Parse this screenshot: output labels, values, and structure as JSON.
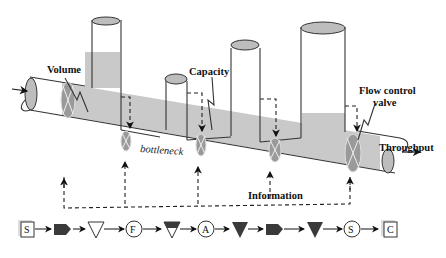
{
  "diagram": {
    "labels": {
      "volume": "Volume",
      "capacity": "Capacity",
      "flow_control_valve_line1": "Flow control",
      "flow_control_valve_line2": "valve",
      "bottleneck": "bottleneck",
      "throughput": "Throughput",
      "information": "Information"
    },
    "colors": {
      "fluid": "#c9c9c9",
      "valve": "#9a9a9a",
      "cap": "#bdbdbd",
      "outline": "#333333",
      "dark_symbol": "#3a3a3a"
    },
    "flow_sequence": [
      {
        "shape": "square",
        "label": "S"
      },
      {
        "shape": "block-arrow",
        "label": ""
      },
      {
        "shape": "triangle-open",
        "label": ""
      },
      {
        "shape": "circle",
        "label": "F"
      },
      {
        "shape": "triangle-half-filled",
        "label": ""
      },
      {
        "shape": "circle",
        "label": "A"
      },
      {
        "shape": "triangle-filled",
        "label": ""
      },
      {
        "shape": "block-arrow",
        "label": ""
      },
      {
        "shape": "triangle-filled",
        "label": ""
      },
      {
        "shape": "circle",
        "label": "S"
      },
      {
        "shape": "square",
        "label": "C"
      }
    ]
  }
}
